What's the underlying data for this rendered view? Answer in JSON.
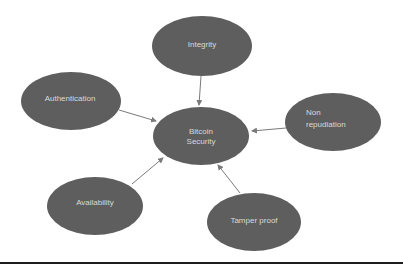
{
  "diagram": {
    "type": "hub-and-spoke",
    "colors": {
      "node_fill": "#5e5e5e",
      "node_text": "#d9d9d9",
      "edge": "#7a7a7a",
      "rule": "#1e1e1e",
      "background": "#ffffff"
    },
    "center": {
      "id": "bitcoin-security",
      "label_lines": [
        "Bitcoin",
        "Security"
      ]
    },
    "nodes": [
      {
        "id": "integrity",
        "label_lines": [
          "Integrity"
        ]
      },
      {
        "id": "authentication",
        "label_lines": [
          "Authentication"
        ]
      },
      {
        "id": "non-repudiation",
        "label_lines": [
          "Non",
          "repudiation"
        ]
      },
      {
        "id": "availability",
        "label_lines": [
          "Availability"
        ]
      },
      {
        "id": "tamper-proof",
        "label_lines": [
          "Tamper proof"
        ]
      }
    ],
    "edges": [
      {
        "from": "integrity",
        "to": "bitcoin-security"
      },
      {
        "from": "authentication",
        "to": "bitcoin-security"
      },
      {
        "from": "non-repudiation",
        "to": "bitcoin-security"
      },
      {
        "from": "availability",
        "to": "bitcoin-security"
      },
      {
        "from": "tamper-proof",
        "to": "bitcoin-security"
      }
    ]
  }
}
